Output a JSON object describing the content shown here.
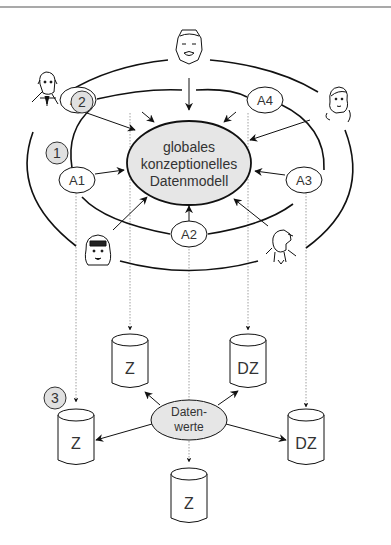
{
  "diagram": {
    "type": "three-schema / ANSI-SPARC data architecture",
    "center_model": {
      "lines": [
        "globales",
        "konzeptionelles",
        "Datenmodell"
      ],
      "fill": "#e6e6e6"
    },
    "applications": [
      {
        "id": "A1",
        "label": "A1"
      },
      {
        "id": "A2",
        "label": "A2"
      },
      {
        "id": "A3",
        "label": "A3"
      },
      {
        "id": "A4",
        "label": "A4"
      },
      {
        "id": "A5",
        "label": "A5"
      }
    ],
    "markers": [
      {
        "id": "1",
        "label": "1"
      },
      {
        "id": "2",
        "label": "2"
      },
      {
        "id": "3",
        "label": "3"
      }
    ],
    "data_values": {
      "lines": [
        "Daten-",
        "werte"
      ],
      "fill": "#e6e6e6"
    },
    "storages": [
      {
        "id": "s1",
        "label": "Z"
      },
      {
        "id": "s2",
        "label": "DZ"
      },
      {
        "id": "s3",
        "label": "Z"
      },
      {
        "id": "s4",
        "label": "DZ"
      },
      {
        "id": "s5",
        "label": "Z"
      }
    ],
    "users": [
      {
        "id": "user-top",
        "description": "older man face"
      },
      {
        "id": "user-top-left",
        "description": "man with tie"
      },
      {
        "id": "user-top-right",
        "description": "woman with long hair"
      },
      {
        "id": "user-bottom-left",
        "description": "woman with bangs"
      },
      {
        "id": "user-bottom-right",
        "description": "man in profile"
      }
    ],
    "colors": {
      "stroke": "#111111",
      "marker_fill": "#e0e0e0",
      "dotted": "#888888"
    }
  }
}
